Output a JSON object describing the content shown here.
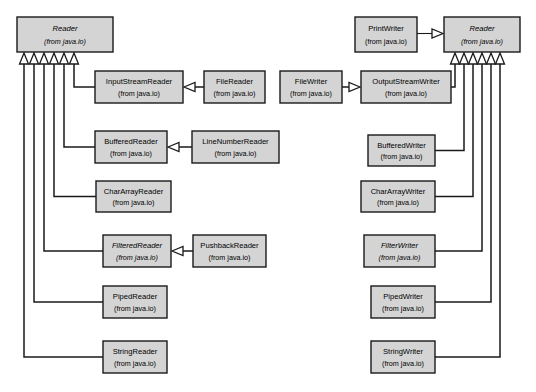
{
  "diagram": {
    "type": "uml-class-diagram",
    "package_label": "(from java.io)",
    "colors": {
      "box_fill": "#d4d4d4",
      "box_stroke": "#1a1a1a",
      "line": "#1a1a1a",
      "arrowhead_fill": "#ffffff",
      "background": "#ffffff"
    },
    "nodes": [
      {
        "id": "reader-left",
        "name": "Reader",
        "package": "(from java.io)",
        "abstract": true,
        "x": 17,
        "y": 17,
        "w": 96,
        "h": 35
      },
      {
        "id": "input-stream-reader",
        "name": "InputStreamReader",
        "package": "(from java.io)",
        "abstract": false,
        "x": 95,
        "y": 71,
        "w": 88,
        "h": 32
      },
      {
        "id": "file-reader",
        "name": "FileReader",
        "package": "(from java.io)",
        "abstract": false,
        "x": 204,
        "y": 71,
        "w": 61,
        "h": 32
      },
      {
        "id": "buffered-reader",
        "name": "BufferedReader",
        "package": "(from java.io)",
        "abstract": false,
        "x": 95,
        "y": 131,
        "w": 72,
        "h": 32
      },
      {
        "id": "line-number-reader",
        "name": "LineNumberReader",
        "package": "(from java.io)",
        "abstract": false,
        "x": 192,
        "y": 131,
        "w": 87,
        "h": 32
      },
      {
        "id": "char-array-reader",
        "name": "CharArrayReader",
        "package": "(from java.io)",
        "abstract": false,
        "x": 96,
        "y": 181,
        "w": 75,
        "h": 31
      },
      {
        "id": "filtered-reader",
        "name": "FilteredReader",
        "package": "(from java.io)",
        "abstract": true,
        "x": 103,
        "y": 235,
        "w": 68,
        "h": 32
      },
      {
        "id": "pushback-reader",
        "name": "PushbackReader",
        "package": "(from java.io)",
        "abstract": false,
        "x": 193,
        "y": 235,
        "w": 73,
        "h": 32
      },
      {
        "id": "piped-reader",
        "name": "PipedReader",
        "package": "(from java.io)",
        "abstract": false,
        "x": 103,
        "y": 286,
        "w": 64,
        "h": 32
      },
      {
        "id": "string-reader",
        "name": "StringReader",
        "package": "(from java.io)",
        "abstract": false,
        "x": 103,
        "y": 341,
        "w": 64,
        "h": 32
      },
      {
        "id": "print-writer",
        "name": "PrintWriter",
        "package": "(from java.io)",
        "abstract": false,
        "x": 355,
        "y": 17,
        "w": 62,
        "h": 35
      },
      {
        "id": "reader-right",
        "name": "Reader",
        "package": "(from java.io)",
        "abstract": true,
        "x": 444,
        "y": 17,
        "w": 76,
        "h": 35
      },
      {
        "id": "file-writer",
        "name": "FileWriter",
        "package": "(from java.io)",
        "abstract": false,
        "x": 280,
        "y": 71,
        "w": 62,
        "h": 32
      },
      {
        "id": "output-stream-writer",
        "name": "OutputStreamWriter",
        "package": "(from java.io)",
        "abstract": false,
        "x": 361,
        "y": 71,
        "w": 90,
        "h": 32
      },
      {
        "id": "buffered-writer",
        "name": "BufferedWriter",
        "package": "(from java.io)",
        "abstract": false,
        "x": 368,
        "y": 135,
        "w": 67,
        "h": 31
      },
      {
        "id": "char-array-writer",
        "name": "CharArrayWriter",
        "package": "(from java.io)",
        "abstract": false,
        "x": 361,
        "y": 181,
        "w": 74,
        "h": 31
      },
      {
        "id": "filter-writer",
        "name": "FilterWriter",
        "package": "(from java.io)",
        "abstract": true,
        "x": 364,
        "y": 235,
        "w": 71,
        "h": 32
      },
      {
        "id": "piped-writer",
        "name": "PipedWriter",
        "package": "(from java.io)",
        "abstract": false,
        "x": 371,
        "y": 286,
        "w": 64,
        "h": 32
      },
      {
        "id": "string-writer",
        "name": "StringWriter",
        "package": "(from java.io)",
        "abstract": false,
        "x": 371,
        "y": 341,
        "w": 64,
        "h": 32
      }
    ],
    "generalizations": [
      {
        "from": "input-stream-reader",
        "to": "reader-left",
        "style": "solid"
      },
      {
        "from": "buffered-reader",
        "to": "reader-left",
        "style": "solid"
      },
      {
        "from": "char-array-reader",
        "to": "reader-left",
        "style": "solid"
      },
      {
        "from": "filtered-reader",
        "to": "reader-left",
        "style": "solid"
      },
      {
        "from": "piped-reader",
        "to": "reader-left",
        "style": "solid"
      },
      {
        "from": "string-reader",
        "to": "reader-left",
        "style": "solid"
      },
      {
        "from": "file-reader",
        "to": "input-stream-reader",
        "style": "solid"
      },
      {
        "from": "line-number-reader",
        "to": "buffered-reader",
        "style": "solid"
      },
      {
        "from": "pushback-reader",
        "to": "filtered-reader",
        "style": "solid"
      },
      {
        "from": "print-writer",
        "to": "reader-right",
        "style": "solid"
      },
      {
        "from": "file-writer",
        "to": "output-stream-writer",
        "style": "solid"
      },
      {
        "from": "output-stream-writer",
        "to": "reader-right",
        "style": "solid"
      },
      {
        "from": "buffered-writer",
        "to": "reader-right",
        "style": "solid"
      },
      {
        "from": "char-array-writer",
        "to": "reader-right",
        "style": "solid"
      },
      {
        "from": "filter-writer",
        "to": "reader-right",
        "style": "solid"
      },
      {
        "from": "piped-writer",
        "to": "reader-right",
        "style": "solid"
      },
      {
        "from": "string-writer",
        "to": "reader-right",
        "style": "solid"
      }
    ],
    "left_trunk_x": [
      24,
      34,
      44,
      54,
      64,
      74
    ],
    "right_trunk_x": [
      455,
      464,
      473,
      482,
      491,
      500
    ]
  }
}
